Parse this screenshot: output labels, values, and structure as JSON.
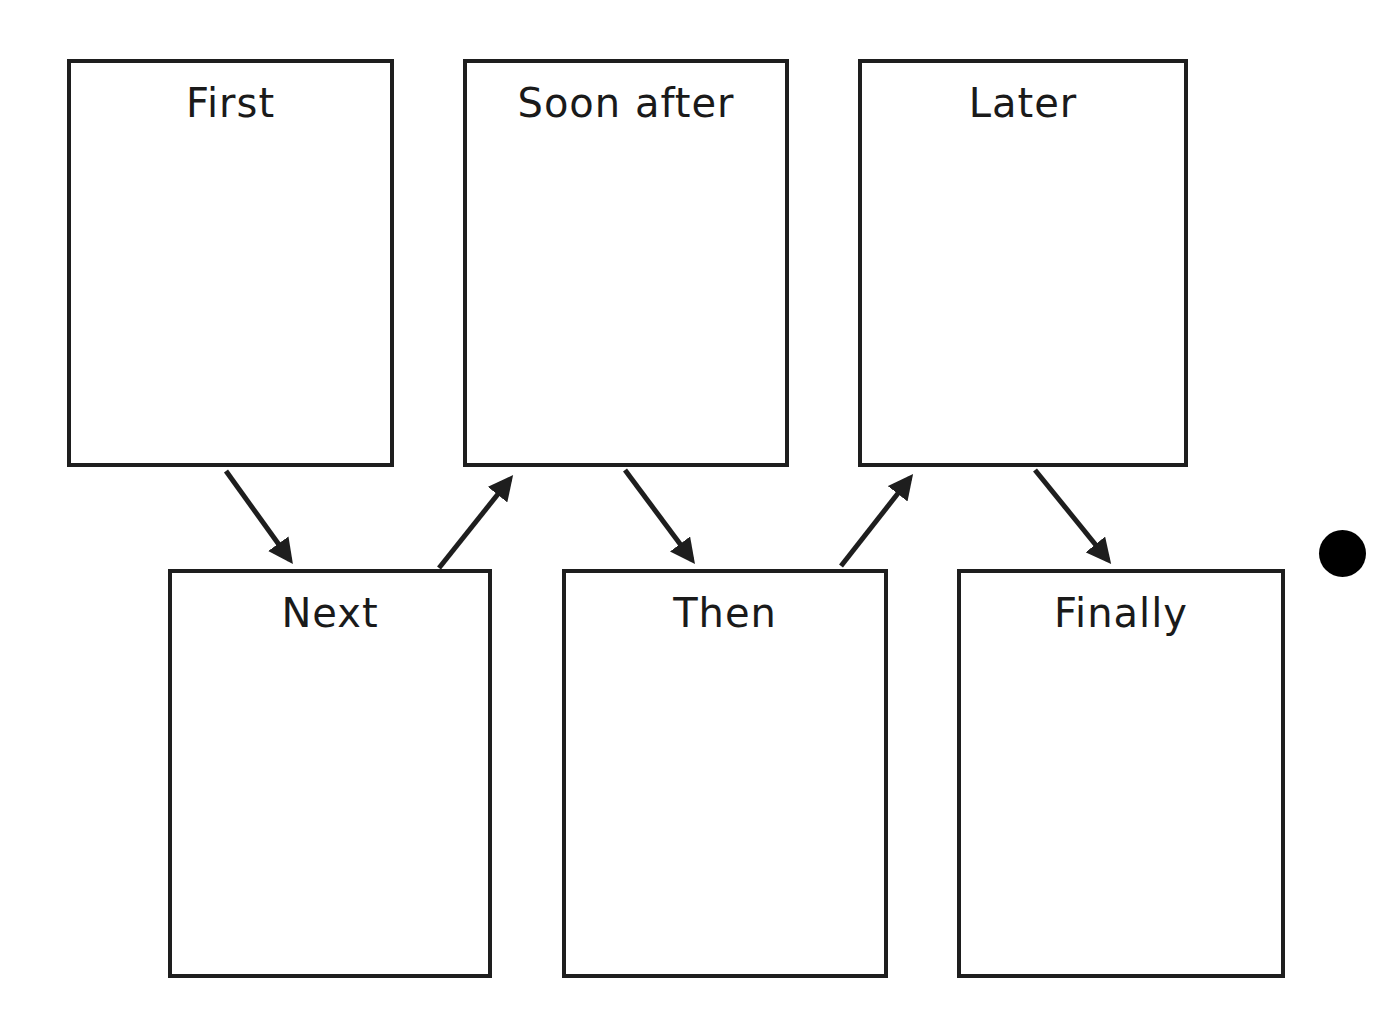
{
  "diagram": {
    "type": "sequence-graphic-organizer",
    "colors": {
      "border": "#1e1e1e",
      "text": "#1a1a1a",
      "background": "#ffffff",
      "dot": "#000000"
    },
    "boxes": [
      {
        "id": "first",
        "label": "First",
        "row": "top",
        "order": 1
      },
      {
        "id": "next",
        "label": "Next",
        "row": "bottom",
        "order": 2
      },
      {
        "id": "soon-after",
        "label": "Soon after",
        "row": "top",
        "order": 3
      },
      {
        "id": "then",
        "label": "Then",
        "row": "bottom",
        "order": 4
      },
      {
        "id": "later",
        "label": "Later",
        "row": "top",
        "order": 5
      },
      {
        "id": "finally",
        "label": "Finally",
        "row": "bottom",
        "order": 6
      }
    ],
    "arrows": [
      {
        "from": "First",
        "to": "Next"
      },
      {
        "from": "Next",
        "to": "Soon after"
      },
      {
        "from": "Soon after",
        "to": "Then"
      },
      {
        "from": "Then",
        "to": "Later"
      },
      {
        "from": "Later",
        "to": "Finally"
      }
    ],
    "marker": {
      "shape": "filled-circle"
    }
  }
}
